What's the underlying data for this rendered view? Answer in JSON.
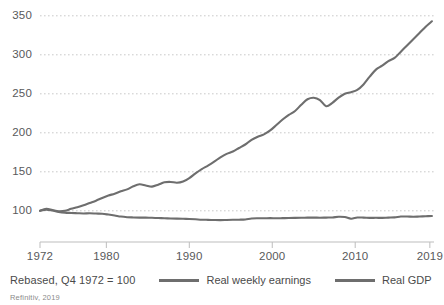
{
  "chart_data": {
    "type": "line",
    "title": "",
    "subtitle": "",
    "xlabel": "",
    "ylabel": "",
    "note": "Rebased, Q4 1972 = 100",
    "source": "Refinitiv, 2019",
    "grid": true,
    "legend_position": "bottom",
    "ylim": [
      60,
      360
    ],
    "yticks": [
      100,
      150,
      200,
      250,
      300,
      350
    ],
    "ytick_labels": [
      "100",
      "150",
      "200",
      "250",
      "300",
      "350"
    ],
    "xlim": [
      1972,
      2019.5
    ],
    "xticks": [
      1972,
      1980,
      1990,
      2000,
      2010,
      2019
    ],
    "xtick_labels": [
      "1972",
      "1980",
      "1990",
      "2000",
      "2010",
      "2019"
    ],
    "line_color": "#6e6e6e",
    "grid_color": "#c9c9c9",
    "axis_color": "#bdbdbd",
    "series": [
      {
        "name": "Real weekly earnings",
        "color": "#6e6e6e",
        "x": [
          1972.0,
          1972.75,
          1973.5,
          1974.25,
          1975.0,
          1975.75,
          1976.5,
          1977.25,
          1978.0,
          1978.75,
          1979.5,
          1980.25,
          1981.0,
          1981.75,
          1982.5,
          1983.25,
          1984.0,
          1984.75,
          1985.5,
          1986.25,
          1987.0,
          1987.75,
          1988.5,
          1989.25,
          1990.0,
          1990.75,
          1991.5,
          1992.25,
          1993.0,
          1993.75,
          1994.5,
          1995.25,
          1996.0,
          1996.75,
          1997.5,
          1998.25,
          1999.0,
          1999.75,
          2000.5,
          2001.25,
          2002.0,
          2002.75,
          2003.5,
          2004.25,
          2005.0,
          2005.75,
          2006.5,
          2007.25,
          2008.0,
          2008.75,
          2009.5,
          2010.25,
          2011.0,
          2011.75,
          2012.5,
          2013.25,
          2014.0,
          2014.75,
          2015.5,
          2016.25,
          2017.0,
          2017.75,
          2018.5,
          2019.25
        ],
        "y": [
          100.0,
          101.5,
          100.3,
          98.6,
          97.6,
          97.2,
          96.9,
          96.6,
          96.8,
          96.5,
          96.2,
          95.2,
          94.0,
          92.6,
          91.8,
          91.5,
          91.3,
          91.2,
          91.0,
          90.7,
          90.4,
          90.2,
          90.0,
          89.8,
          89.5,
          89.1,
          88.6,
          88.4,
          88.2,
          88.1,
          88.3,
          88.5,
          88.6,
          88.9,
          90.2,
          90.5,
          90.4,
          90.6,
          90.4,
          90.6,
          90.8,
          90.9,
          91.1,
          91.2,
          91.3,
          91.1,
          91.3,
          91.5,
          92.4,
          92.0,
          89.9,
          91.4,
          91.3,
          90.9,
          91.0,
          90.9,
          91.3,
          91.6,
          92.6,
          92.7,
          92.4,
          92.7,
          93.0,
          93.4
        ]
      },
      {
        "name": "Real GDP",
        "color": "#6e6e6e",
        "x": [
          1972.0,
          1972.75,
          1973.5,
          1974.25,
          1975.0,
          1975.75,
          1976.5,
          1977.25,
          1978.0,
          1978.75,
          1979.5,
          1980.25,
          1981.0,
          1981.75,
          1982.5,
          1983.25,
          1984.0,
          1984.75,
          1985.5,
          1986.25,
          1987.0,
          1987.75,
          1988.5,
          1989.25,
          1990.0,
          1990.75,
          1991.5,
          1992.25,
          1993.0,
          1993.75,
          1994.5,
          1995.25,
          1996.0,
          1996.75,
          1997.5,
          1998.25,
          1999.0,
          1999.75,
          2000.5,
          2001.25,
          2002.0,
          2002.75,
          2003.5,
          2004.25,
          2005.0,
          2005.75,
          2006.5,
          2007.25,
          2008.0,
          2008.75,
          2009.5,
          2010.25,
          2011.0,
          2011.75,
          2012.5,
          2013.25,
          2014.0,
          2014.75,
          2015.5,
          2016.25,
          2017.0,
          2017.75,
          2018.5,
          2019.25
        ],
        "y": [
          100.0,
          102.5,
          101.0,
          99.5,
          100.0,
          102.5,
          104.5,
          107.0,
          110.0,
          113.0,
          116.5,
          119.5,
          122.0,
          125.0,
          127.5,
          131.5,
          134.0,
          132.5,
          131.0,
          133.5,
          136.5,
          137.0,
          136.0,
          137.5,
          142.0,
          148.0,
          153.5,
          158.0,
          163.0,
          168.5,
          173.0,
          176.0,
          180.5,
          185.0,
          191.0,
          195.0,
          198.0,
          203.0,
          210.0,
          217.0,
          223.0,
          228.0,
          236.0,
          243.0,
          245.0,
          242.0,
          234.0,
          238.5,
          245.0,
          250.0,
          252.0,
          255.0,
          262.0,
          272.0,
          281.0,
          286.0,
          292.0,
          296.0,
          304.0,
          312.0,
          320.0,
          328.0,
          336.0,
          343.0
        ]
      }
    ]
  },
  "legend": [
    {
      "label": "Real weekly earnings",
      "color": "#6e6e6e"
    },
    {
      "label": "Real GDP",
      "color": "#6e6e6e"
    }
  ],
  "footer": {
    "note": "Rebased, Q4 1972 = 100",
    "source": "Refinitiv, 2019"
  }
}
